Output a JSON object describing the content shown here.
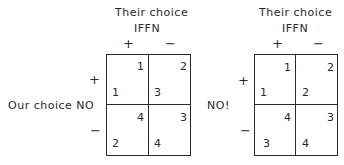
{
  "left_matrix": {
    "col_title": "Their choice",
    "col_subtitle": "IFFN",
    "col_plus": "+",
    "col_minus": "−",
    "row_label": "Our choice  NO",
    "row_plus": "+",
    "row_minus": "−",
    "cells": {
      "pp": {
        "their": "1",
        "our": "1"
      },
      "pm": {
        "their": "2",
        "our": "3"
      },
      "mp": {
        "their": "4",
        "our": "2"
      },
      "mm": {
        "their": "3",
        "our": "4"
      }
    }
  },
  "right_matrix": {
    "col_title": "Their choice",
    "col_subtitle": "IFFN",
    "col_plus": "+",
    "col_minus": "−",
    "row_label": "NO!",
    "row_plus": "+",
    "row_minus": "−",
    "cells": {
      "pp": {
        "their": "1",
        "our": "1"
      },
      "pm": {
        "their": "2",
        "our": "2"
      },
      "mp": {
        "their": "4",
        "our": "3"
      },
      "mm": {
        "their": "3",
        "our": "4"
      }
    }
  }
}
